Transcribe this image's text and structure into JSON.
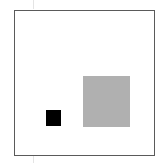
{
  "canvas": {
    "width": 163,
    "height": 163,
    "background": "#ffffff"
  },
  "frame": {
    "x": 14,
    "y": 10,
    "width": 140,
    "height": 145,
    "stroke": "#5a5a5a"
  },
  "shapes": [
    {
      "name": "small-black-square",
      "x": 46,
      "y": 110,
      "width": 15,
      "height": 16,
      "color": "#000000"
    },
    {
      "name": "large-gray-square",
      "x": 83,
      "y": 76,
      "width": 47,
      "height": 51,
      "color": "#b0b0b0"
    }
  ],
  "guides": [
    {
      "x": 33,
      "y": 0,
      "height": 9
    },
    {
      "x": 33,
      "y": 156,
      "height": 7
    }
  ]
}
